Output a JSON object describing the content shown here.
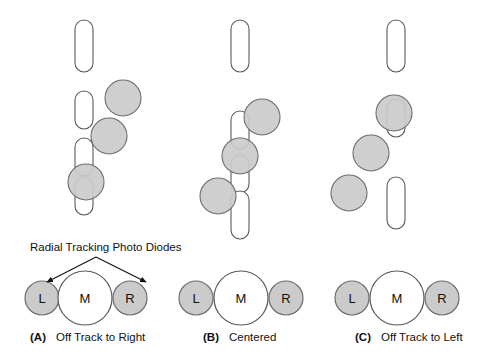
{
  "figure": {
    "title": "Radial Tracking Photo Diodes",
    "width": 481,
    "height": 360,
    "background_color": "#ffffff"
  },
  "colors": {
    "spot_fill": "#cbcbcb",
    "spot_stroke": "#6d6d6d",
    "pit_fill": "#ffffff",
    "pit_stroke": "#5a5a5a",
    "text": "#111111"
  },
  "annotation": {
    "label": "Radial Tracking Photo Diodes",
    "label_x": 30,
    "label_y": 251,
    "apex_x": 96,
    "apex_y": 257,
    "arrow_left_end_x": 47,
    "arrow_left_end_y": 282,
    "arrow_right_end_x": 146,
    "arrow_right_end_y": 282
  },
  "panels": [
    {
      "id": "A",
      "tag": "(A)",
      "caption": "Off Track to Right",
      "caption_x": 30,
      "caption_y": 341,
      "track_x": 84,
      "pits": [
        {
          "x": 84,
          "y": 46,
          "rx": 9,
          "ry": 26
        },
        {
          "x": 84,
          "y": 110,
          "rx": 9,
          "ry": 19
        },
        {
          "x": 84,
          "y": 157,
          "rx": 9,
          "ry": 19
        },
        {
          "x": 84,
          "y": 196,
          "rx": 9,
          "ry": 19
        }
      ],
      "spots": [
        {
          "x": 123,
          "y": 98,
          "r": 18
        },
        {
          "x": 109,
          "y": 136,
          "r": 18
        },
        {
          "x": 86,
          "y": 182,
          "r": 18
        }
      ],
      "diodes": [
        {
          "name": "L",
          "label": "L",
          "x": 42,
          "y": 298,
          "r": 17,
          "shaded": true
        },
        {
          "name": "M",
          "label": "M",
          "x": 85,
          "y": 298,
          "r": 27,
          "shaded": false
        },
        {
          "name": "R",
          "label": "R",
          "x": 130,
          "y": 298,
          "r": 17,
          "shaded": true
        }
      ]
    },
    {
      "id": "B",
      "tag": "(B)",
      "caption": "Centered",
      "caption_x": 203,
      "caption_y": 341,
      "track_x": 240,
      "pits": [
        {
          "x": 240,
          "y": 46,
          "rx": 9,
          "ry": 26
        },
        {
          "x": 240,
          "y": 130,
          "rx": 9,
          "ry": 19
        },
        {
          "x": 240,
          "y": 174,
          "rx": 9,
          "ry": 19
        },
        {
          "x": 240,
          "y": 215,
          "rx": 9,
          "ry": 24
        }
      ],
      "spots": [
        {
          "x": 262,
          "y": 117,
          "r": 18
        },
        {
          "x": 240,
          "y": 156,
          "r": 18
        },
        {
          "x": 218,
          "y": 196,
          "r": 18
        }
      ],
      "diodes": [
        {
          "name": "L",
          "label": "L",
          "x": 196,
          "y": 298,
          "r": 17,
          "shaded": true
        },
        {
          "name": "M",
          "label": "M",
          "x": 241,
          "y": 298,
          "r": 27,
          "shaded": false
        },
        {
          "name": "R",
          "label": "R",
          "x": 286,
          "y": 298,
          "r": 17,
          "shaded": true
        }
      ]
    },
    {
      "id": "C",
      "tag": "(C)",
      "caption": "Off Track to Left",
      "caption_x": 355,
      "caption_y": 341,
      "track_x": 396,
      "pits": [
        {
          "x": 396,
          "y": 46,
          "rx": 9,
          "ry": 26
        },
        {
          "x": 396,
          "y": 118,
          "rx": 9,
          "ry": 19
        },
        {
          "x": 396,
          "y": 203,
          "rx": 9,
          "ry": 26
        }
      ],
      "spots": [
        {
          "x": 394,
          "y": 113,
          "r": 18
        },
        {
          "x": 371,
          "y": 153,
          "r": 18
        },
        {
          "x": 349,
          "y": 193,
          "r": 18
        }
      ],
      "diodes": [
        {
          "name": "L",
          "label": "L",
          "x": 352,
          "y": 298,
          "r": 17,
          "shaded": true
        },
        {
          "name": "M",
          "label": "M",
          "x": 397,
          "y": 298,
          "r": 27,
          "shaded": false
        },
        {
          "name": "R",
          "label": "R",
          "x": 442,
          "y": 298,
          "r": 17,
          "shaded": true
        }
      ]
    }
  ]
}
